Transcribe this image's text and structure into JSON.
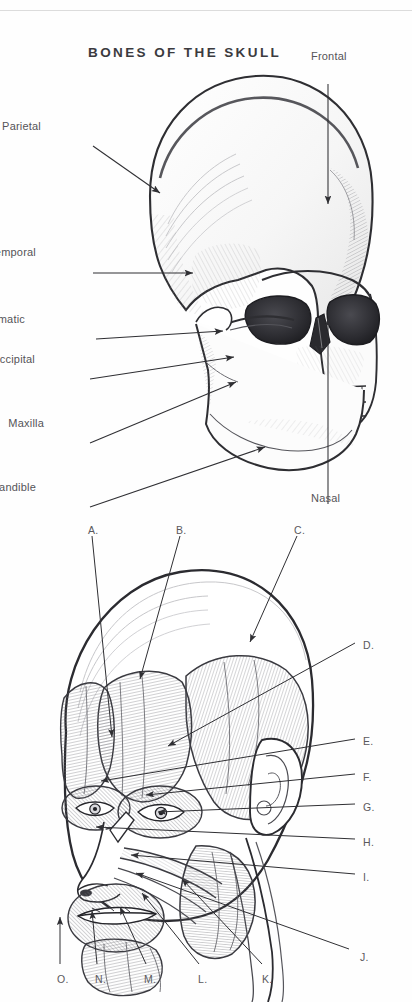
{
  "page": {
    "background": "#fefefe",
    "ink": "#555458",
    "line_color": "#2f2f33"
  },
  "figure_skull": {
    "title": "BONES OF THE SKULL",
    "subject": "lateral-oblique pencil drawing of a human skull",
    "labels": [
      {
        "id": "frontal",
        "text": "Frontal",
        "side": "right",
        "x": 311,
        "y": 50,
        "leader": {
          "x1": 328,
          "x2": 328,
          "y1": 66,
          "y2": 190,
          "arrow": "down"
        }
      },
      {
        "id": "parietal",
        "text": "Parietal",
        "side": "left",
        "x": 41,
        "y": 120,
        "leader": {
          "x1": 93,
          "x2": 163,
          "y1": 128,
          "y2": 177,
          "arrow": "right-down"
        }
      },
      {
        "id": "temporal",
        "text": "Temporal",
        "side": "left",
        "x": 36,
        "y": 246,
        "leader": {
          "x1": 93,
          "x2": 196,
          "y1": 255,
          "y2": 255,
          "arrow": "right"
        }
      },
      {
        "id": "zygomatic",
        "text": "Zygomatic",
        "side": "left",
        "x": 25,
        "y": 313,
        "leader": {
          "x1": 93,
          "x2": 226,
          "y1": 321,
          "y2": 313,
          "arrow": "right"
        }
      },
      {
        "id": "occipital",
        "text": "Occipital",
        "side": "left",
        "x": 35,
        "y": 353,
        "leader": {
          "x1": 93,
          "x2": 237,
          "y1": 361,
          "y2": 338,
          "arrow": "right-up"
        }
      },
      {
        "id": "maxilla",
        "text": "Maxilla",
        "side": "left",
        "x": 44,
        "y": 417,
        "leader": {
          "x1": 93,
          "x2": 239,
          "y1": 425,
          "y2": 363,
          "arrow": "right-up"
        }
      },
      {
        "id": "mandible",
        "text": "Mandible",
        "side": "left",
        "x": 36,
        "y": 481,
        "leader": {
          "x1": 93,
          "x2": 268,
          "y1": 489,
          "y2": 428,
          "arrow": "right-up"
        }
      },
      {
        "id": "nasal",
        "text": "Nasal",
        "side": "bottom",
        "x": 311,
        "y": 492,
        "leader": {
          "x1": 328,
          "x2": 328,
          "y1": 486,
          "y2": 296,
          "arrow": "up"
        }
      }
    ]
  },
  "figure_muscles": {
    "subject": "pencil drawing of the superficial muscles of the head and face",
    "keys": [
      {
        "letter": "A.",
        "x": 88,
        "y": 524,
        "pos": "top",
        "leader": {
          "x1": 92,
          "x2": 112,
          "y1": 536,
          "y2": 740
        }
      },
      {
        "letter": "B.",
        "x": 176,
        "y": 524,
        "pos": "top",
        "leader": {
          "x1": 180,
          "x2": 138,
          "y1": 536,
          "y2": 682
        }
      },
      {
        "letter": "C.",
        "x": 294,
        "y": 524,
        "pos": "top",
        "leader": {
          "x1": 297,
          "x2": 247,
          "y1": 536,
          "y2": 645
        }
      },
      {
        "letter": "D.",
        "x": 363,
        "y": 639,
        "pos": "right",
        "leader": {
          "x1": 359,
          "x2": 165,
          "y1": 645,
          "y2": 748
        }
      },
      {
        "letter": "E.",
        "x": 363,
        "y": 735,
        "pos": "right",
        "leader": {
          "x1": 359,
          "x2": 98,
          "y1": 741,
          "y2": 782
        }
      },
      {
        "letter": "F.",
        "x": 363,
        "y": 771,
        "pos": "right",
        "leader": {
          "x1": 359,
          "x2": 143,
          "y1": 776,
          "y2": 796
        }
      },
      {
        "letter": "G.",
        "x": 363,
        "y": 801,
        "pos": "right",
        "leader": {
          "x1": 359,
          "x2": 155,
          "y1": 806,
          "y2": 813
        }
      },
      {
        "letter": "H.",
        "x": 363,
        "y": 836,
        "pos": "right",
        "leader": {
          "x1": 359,
          "x2": 93,
          "y1": 841,
          "y2": 828
        }
      },
      {
        "letter": "I.",
        "x": 363,
        "y": 871,
        "pos": "right",
        "leader": {
          "x1": 359,
          "x2": 128,
          "y1": 876,
          "y2": 856
        }
      },
      {
        "letter": "J.",
        "x": 360,
        "y": 951,
        "pos": "right",
        "leader": {
          "x1": 352,
          "x2": 133,
          "y1": 951,
          "y2": 872
        }
      },
      {
        "letter": "K.",
        "x": 262,
        "y": 973,
        "pos": "bottom",
        "leader": {
          "x1": 262,
          "x2": 180,
          "y1": 966,
          "y2": 880
        }
      },
      {
        "letter": "L.",
        "x": 198,
        "y": 973,
        "pos": "bottom",
        "leader": {
          "x1": 199,
          "x2": 140,
          "y1": 966,
          "y2": 894
        }
      },
      {
        "letter": "M.",
        "x": 144,
        "y": 973,
        "pos": "bottom",
        "leader": {
          "x1": 146,
          "x2": 119,
          "y1": 966,
          "y2": 908
        }
      },
      {
        "letter": "N.",
        "x": 95,
        "y": 973,
        "pos": "bottom",
        "leader": {
          "x1": 97,
          "x2": 91,
          "y1": 966,
          "y2": 912
        }
      },
      {
        "letter": "O.",
        "x": 57,
        "y": 973,
        "pos": "bottom",
        "leader": {
          "x1": 60,
          "x2": 60,
          "y1": 966,
          "y2": 918
        }
      }
    ]
  }
}
